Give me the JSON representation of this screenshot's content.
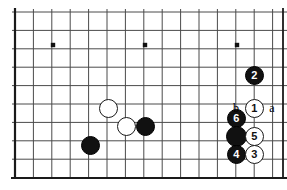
{
  "board": {
    "type": "go-board-diagram",
    "edges": {
      "left": 15,
      "top": 12,
      "right": 283,
      "bottom": 178
    },
    "grid_spacing": 18.4,
    "line_color": "#4a4a4a",
    "border_color": "#1a1a1a",
    "background_color": "#ffffff",
    "columns": 15,
    "rows": 10,
    "star_points": [
      {
        "x": 53,
        "y": 45
      },
      {
        "x": 145,
        "y": 45
      },
      {
        "x": 237,
        "y": 45
      }
    ],
    "black_color": "#111111",
    "white_color": "#ffffff"
  },
  "stones": [
    {
      "id": "white-upper-left",
      "color": "white",
      "label": "",
      "x": 108,
      "y": 108,
      "d": 19
    },
    {
      "id": "white-lower-left",
      "color": "white",
      "label": "",
      "x": 126,
      "y": 126,
      "d": 19
    },
    {
      "id": "black-lower-left",
      "color": "black",
      "label": "",
      "x": 90,
      "y": 145,
      "d": 19
    },
    {
      "id": "black-lower-mid",
      "color": "black",
      "label": "",
      "x": 145,
      "y": 126,
      "d": 19
    },
    {
      "id": "black-move-2",
      "color": "black",
      "label": "2",
      "x": 254,
      "y": 75,
      "d": 19
    },
    {
      "id": "white-move-1",
      "color": "white",
      "label": "1",
      "x": 254,
      "y": 108,
      "d": 19
    },
    {
      "id": "black-move-6",
      "color": "black",
      "label": "6",
      "x": 236,
      "y": 118,
      "d": 19
    },
    {
      "id": "black-plain-right",
      "color": "black",
      "label": "",
      "x": 236,
      "y": 136,
      "d": 21
    },
    {
      "id": "white-move-5",
      "color": "white",
      "label": "5",
      "x": 254,
      "y": 136,
      "d": 19
    },
    {
      "id": "black-move-4",
      "color": "black",
      "label": "4",
      "x": 236,
      "y": 154,
      "d": 19
    },
    {
      "id": "white-move-3",
      "color": "white",
      "label": "3",
      "x": 254,
      "y": 154,
      "d": 19
    }
  ],
  "markers": [
    {
      "id": "point-b",
      "label": "b",
      "x": 236,
      "y": 108
    },
    {
      "id": "point-a",
      "label": "a",
      "x": 272,
      "y": 108
    }
  ]
}
